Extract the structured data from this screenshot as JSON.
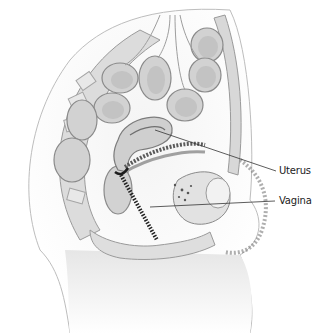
{
  "figure": {
    "labels": [
      {
        "id": "uterus",
        "text": "Uterus",
        "x": 279,
        "y": 165,
        "line": [
          155,
          130,
          276,
          171
        ]
      },
      {
        "id": "vagina",
        "text": "Vagina",
        "x": 279,
        "y": 195,
        "line": [
          150,
          207,
          275,
          201
        ]
      }
    ],
    "colors": {
      "background": "#ffffff",
      "tissue_light": "#e4e4e4",
      "tissue_mid": "#c8c8c8",
      "tissue_dark": "#8a8a8a",
      "line": "#333333"
    }
  }
}
